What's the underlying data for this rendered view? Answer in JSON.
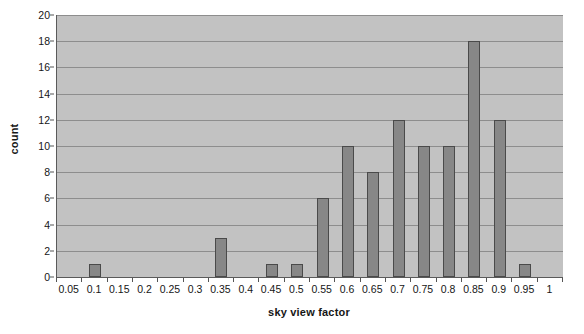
{
  "chart_data": {
    "type": "bar",
    "title": "",
    "subtitle": "",
    "xlabel": "sky view factor",
    "ylabel": "count",
    "categories": [
      "0.05",
      "0.1",
      "0.15",
      "0.2",
      "0.25",
      "0.3",
      "0.35",
      "0.4",
      "0.45",
      "0.5",
      "0.55",
      "0.6",
      "0.65",
      "0.7",
      "0.75",
      "0.8",
      "0.85",
      "0.9",
      "0.95",
      "1"
    ],
    "values": [
      0,
      1,
      0,
      0,
      0,
      0,
      3,
      0,
      1,
      1,
      6,
      10,
      8,
      12,
      10,
      10,
      18,
      12,
      1,
      0
    ],
    "x_tick_labels": [
      "0.05",
      "0.1",
      "0.15",
      "0.2",
      "0.25",
      "0.3",
      "0.35",
      "0.4",
      "0.45",
      "0.5",
      "0.55",
      "0.6",
      "0.65",
      "0.7",
      "0.75",
      "0.8",
      "0.85",
      "0.9",
      "0.95",
      "1"
    ],
    "y_tick_labels": [
      "0",
      "2",
      "4",
      "6",
      "8",
      "10",
      "12",
      "14",
      "16",
      "18",
      "20"
    ],
    "y_tick_values": [
      0,
      2,
      4,
      6,
      8,
      10,
      12,
      14,
      16,
      18,
      20
    ],
    "ylim": [
      0,
      20
    ],
    "y_tick_step": 2,
    "grid": true,
    "grid_axis": "y",
    "legend": false,
    "legend_position": "none",
    "bar_color": "#878787",
    "bar_border_color": "#4a4a4a",
    "plot_background_color": "#c2c2c2",
    "gridline_color": "#8d8d8d",
    "axis_color": "#5a5a5a",
    "text_color": "#161616",
    "figure_background_color": "#ffffff"
  }
}
